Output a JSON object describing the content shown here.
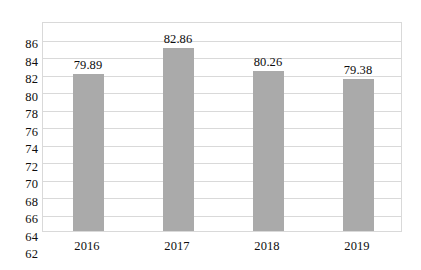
{
  "chart_data": {
    "type": "bar",
    "title": "",
    "subtitle": "",
    "xlabel": "",
    "ylabel": "",
    "categories": [
      "2016",
      "2017",
      "2018",
      "2019"
    ],
    "values": [
      79.89,
      82.86,
      80.26,
      79.38
    ],
    "value_labels": [
      "79.89",
      "82.86",
      "80.26",
      "79.38"
    ],
    "series": [
      {
        "name": "",
        "values": [
          79.89,
          82.86,
          80.26,
          79.38
        ],
        "color": "#aaaaaa"
      }
    ],
    "ylim": [
      62,
      86
    ],
    "ytick_step": 2,
    "ytick_labels": [
      "86",
      "84",
      "82",
      "80",
      "78",
      "76",
      "74",
      "72",
      "70",
      "68",
      "66",
      "64",
      "62"
    ],
    "ytick_values": [
      86,
      84,
      82,
      80,
      78,
      76,
      74,
      72,
      70,
      68,
      66,
      64,
      62
    ],
    "grid": true,
    "grid_axis": "y",
    "grid_color": "#d9d9d9",
    "legend": false,
    "legend_position": "none",
    "plot_border_color": "#d9d9d9",
    "background_color": "#ffffff",
    "text_color": "#0d0d0d",
    "data_labels_shown": true
  }
}
